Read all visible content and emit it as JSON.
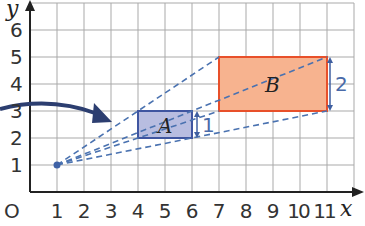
{
  "diagram": {
    "type": "enlargement-on-grid",
    "axes": {
      "x_label": "x",
      "y_label": "y",
      "origin_label": "O",
      "x_ticks": [
        "1",
        "2",
        "3",
        "4",
        "5",
        "6",
        "7",
        "8",
        "9",
        "10",
        "11"
      ],
      "y_ticks": [
        "1",
        "2",
        "3",
        "4",
        "5",
        "6"
      ]
    },
    "centre_of_enlargement": {
      "x": 1,
      "y": 1
    },
    "shapes": [
      {
        "name": "A",
        "x1": 4,
        "y1": 2,
        "x2": 6,
        "y2": 3,
        "height_label": "1",
        "fill": "#b8bde0",
        "stroke": "#3f55a0"
      },
      {
        "name": "B",
        "x1": 7,
        "y1": 3,
        "x2": 11,
        "y2": 5,
        "height_label": "2",
        "fill": "#f7b38f",
        "stroke": "#e8502a"
      }
    ],
    "rays_from_centre_to": [
      [
        6,
        3
      ],
      [
        6,
        2
      ],
      [
        11,
        5
      ],
      [
        11,
        3
      ]
    ],
    "colors": {
      "grid": "#a9a9a9",
      "axis": "#222222",
      "ray": "#4a72b0",
      "arrow": "#2c3e70"
    }
  }
}
